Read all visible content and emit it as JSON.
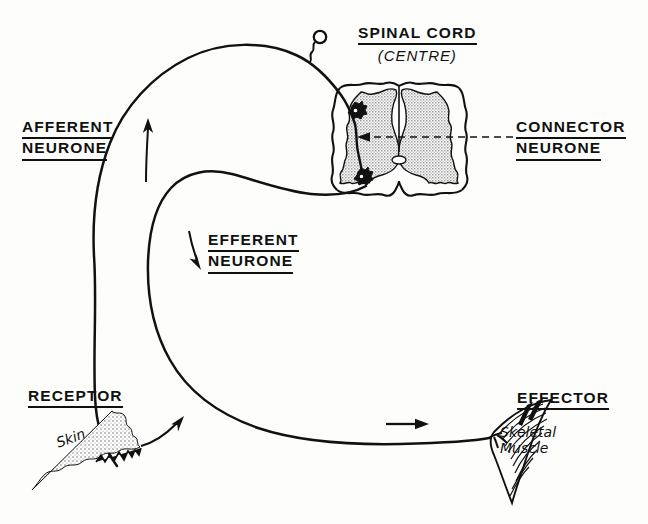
{
  "diagram": {
    "background_color": "#fdfdfc",
    "ink_color": "#111111",
    "grey_matter_color": "#b9b9b9"
  },
  "labels": {
    "spinal_cord": {
      "line1": "SPINAL CORD",
      "line2": "(CENTRE)"
    },
    "afferent_neurone": {
      "line1": "AFFERENT",
      "line2": "NEURONE"
    },
    "connector_neurone": {
      "line1": "CONNECTOR",
      "line2": "NEURONE"
    },
    "efferent_neurone": {
      "line1": "EFFERENT",
      "line2": "NEURONE"
    },
    "receptor": {
      "line1": "RECEPTOR"
    },
    "effector": {
      "line1": "EFFECTOR"
    },
    "skin": {
      "line1": "Skin"
    },
    "skeletal_muscle": {
      "line1": "Skeletal",
      "line2": "Muscle"
    }
  },
  "structures": [
    {
      "name": "afferent-neurone-fibre",
      "role": "sensory pathway from skin receptor to spinal cord"
    },
    {
      "name": "dorsal-root-ganglion-cell-body",
      "role": "cell body of afferent neurone"
    },
    {
      "name": "connector-neurone",
      "role": "interneurone inside grey matter"
    },
    {
      "name": "efferent-neurone-fibre",
      "role": "motor pathway from spinal cord to skeletal muscle"
    },
    {
      "name": "spinal-cord-cross-section",
      "role": "centre of the reflex arc"
    },
    {
      "name": "grey-matter",
      "role": "butterfly-shaped grey matter"
    },
    {
      "name": "skin-receptor",
      "role": "sensory receptor in skin"
    },
    {
      "name": "skeletal-muscle-effector",
      "role": "effector organ"
    }
  ],
  "arrows": [
    {
      "name": "afferent-direction-arrow",
      "direction": "up"
    },
    {
      "name": "efferent-direction-arrow",
      "direction": "down"
    },
    {
      "name": "receptor-impulse-arrow",
      "direction": "up-right"
    },
    {
      "name": "effector-impulse-arrow",
      "direction": "right"
    },
    {
      "name": "connector-pointer-arrow",
      "direction": "left",
      "style": "dashed"
    }
  ]
}
